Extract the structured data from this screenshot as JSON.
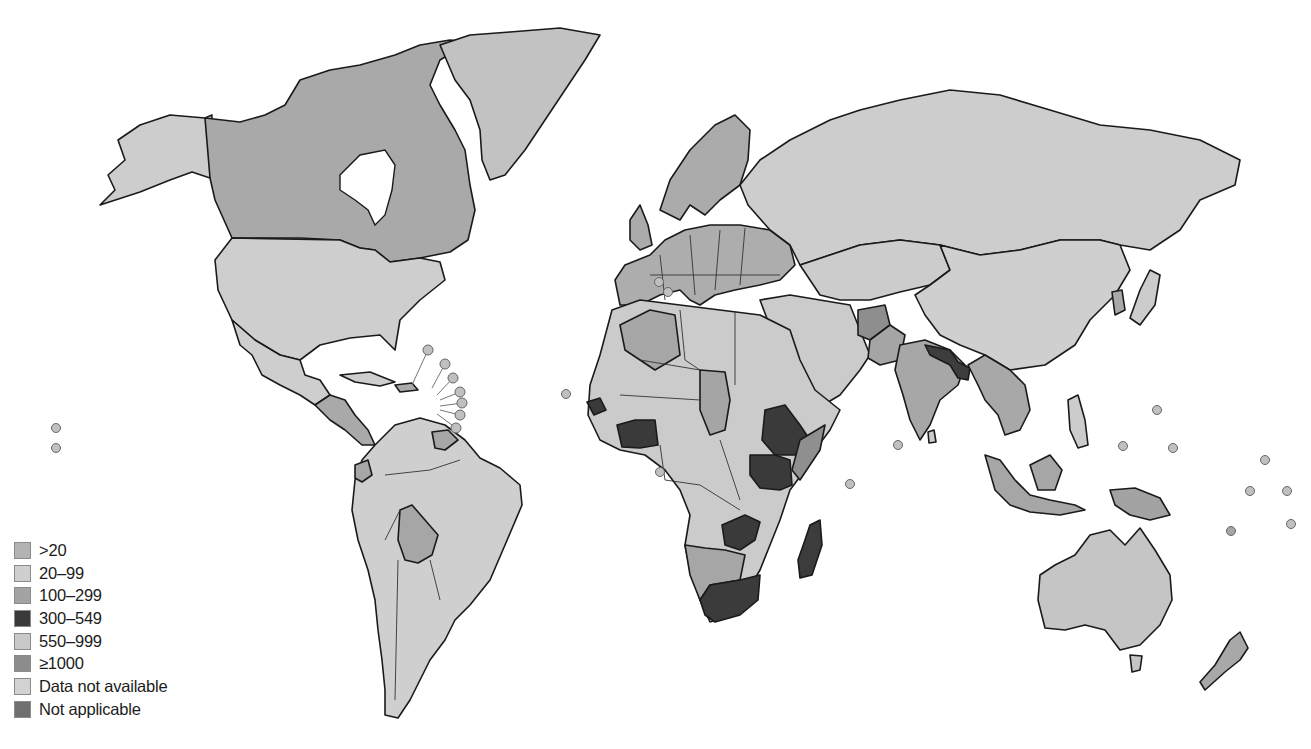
{
  "map": {
    "type": "choropleth",
    "projection": "world",
    "colors": {
      "water": "#ffffff",
      "outline": "#1a1a1a"
    }
  },
  "legend": {
    "items": [
      {
        "label": ">20",
        "color": "#b3b3b3"
      },
      {
        "label": "20–99",
        "color": "#cfcfcf"
      },
      {
        "label": "100–299",
        "color": "#a3a3a3"
      },
      {
        "label": "300–549",
        "color": "#3a3a3a"
      },
      {
        "label": "550–999",
        "color": "#c9c9c9"
      },
      {
        "label": "≥1000",
        "color": "#8c8c8c"
      },
      {
        "label": "Data not available",
        "color": "#d2d2d2"
      },
      {
        "label": "Not applicable",
        "color": "#6f6f6f"
      }
    ]
  },
  "regions": [
    {
      "name": "Alaska",
      "category": "20–99"
    },
    {
      "name": "Canada",
      "category": "100–299"
    },
    {
      "name": "Greenland",
      "category": "550–999"
    },
    {
      "name": "United States",
      "category": "20–99"
    },
    {
      "name": "Mexico",
      "category": "20–99"
    },
    {
      "name": "Central America",
      "category": "100–299"
    },
    {
      "name": "South America",
      "category": "20–99"
    },
    {
      "name": "Bolivia",
      "category": "100–299"
    },
    {
      "name": "Europe",
      "category": "100–299"
    },
    {
      "name": "Russia",
      "category": "20–99"
    },
    {
      "name": "North Africa",
      "category": "20–99"
    },
    {
      "name": "Algeria",
      "category": "100–299"
    },
    {
      "name": "Chad",
      "category": "100–299"
    },
    {
      "name": "Senegal",
      "category": "300–549"
    },
    {
      "name": "Ivory Coast / Ghana",
      "category": "300–549"
    },
    {
      "name": "Ethiopia",
      "category": "300–549"
    },
    {
      "name": "Kenya / Uganda",
      "category": "300–549"
    },
    {
      "name": "Zambia",
      "category": "300–549"
    },
    {
      "name": "South Africa",
      "category": "300–549"
    },
    {
      "name": "Madagascar",
      "category": "300–549"
    },
    {
      "name": "Namibia / Botswana",
      "category": "100–299"
    },
    {
      "name": "Middle East",
      "category": "20–99"
    },
    {
      "name": "Afghanistan",
      "category": "≥1000"
    },
    {
      "name": "India / Pakistan",
      "category": "100–299"
    },
    {
      "name": "Nepal / Bangladesh",
      "category": "300–549"
    },
    {
      "name": "China",
      "category": "20–99"
    },
    {
      "name": "Southeast Asia",
      "category": "100–299"
    },
    {
      "name": "Indonesia",
      "category": "100–299"
    },
    {
      "name": "Papua New Guinea",
      "category": "100–299"
    },
    {
      "name": "Australia",
      "category": "550–999"
    },
    {
      "name": "New Zealand",
      "category": "100–299"
    },
    {
      "name": "Japan",
      "category": "20–99"
    }
  ]
}
